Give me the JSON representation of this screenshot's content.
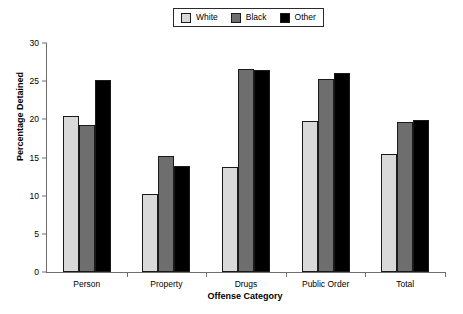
{
  "chart_data": {
    "type": "bar",
    "title": "",
    "xlabel": "Offense Category",
    "ylabel": "Percentage Detained",
    "categories": [
      "Person",
      "Property",
      "Drugs",
      "Public Order",
      "Total"
    ],
    "series": [
      {
        "name": "White",
        "color": "#d9d9d9",
        "values": [
          20.4,
          10.2,
          13.7,
          19.8,
          15.4
        ]
      },
      {
        "name": "Black",
        "color": "#6e6e6e",
        "values": [
          19.3,
          15.2,
          26.6,
          25.3,
          19.6
        ]
      },
      {
        "name": "Other",
        "color": "#000000",
        "values": [
          25.1,
          13.9,
          26.4,
          26.1,
          19.9
        ]
      }
    ],
    "ylim": [
      0,
      30
    ],
    "yticks": [
      0,
      5,
      10,
      15,
      20,
      25,
      30
    ],
    "ytick_labels": [
      "0",
      "5",
      "10",
      "15",
      "20",
      "25",
      "30"
    ],
    "grid": false,
    "legend_position": "top-center",
    "legend_entries": [
      "White",
      "Black",
      "Other"
    ]
  },
  "legend": {
    "items": [
      {
        "label": "White",
        "swatch": "legend-swatch-white"
      },
      {
        "label": "Black",
        "swatch": "legend-swatch-black"
      },
      {
        "label": "Other",
        "swatch": "legend-swatch-other"
      }
    ]
  },
  "axes": {
    "x_title": "Offense Category",
    "y_title": "Percentage Detained"
  }
}
